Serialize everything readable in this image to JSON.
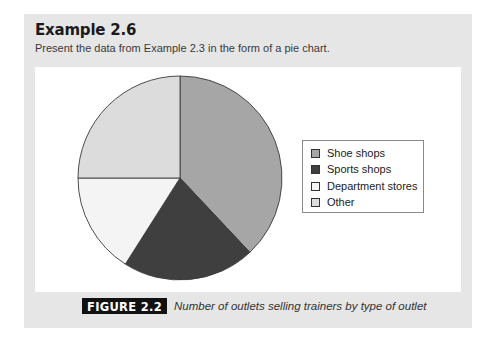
{
  "header": {
    "title": "Example 2.6",
    "subtitle": "Present the data from Example 2.3 in the form of a pie chart."
  },
  "figure": {
    "label": "FIGURE 2.2",
    "caption": "Number of outlets selling trainers by type of outlet"
  },
  "legend": {
    "items": [
      {
        "label": "Shoe shops",
        "color": "#a6a6a6"
      },
      {
        "label": "Sports shops",
        "color": "#3f3f3f"
      },
      {
        "label": "Department stores",
        "color": "#f4f4f4"
      },
      {
        "label": "Other",
        "color": "#dcdcdc"
      }
    ]
  },
  "chart_data": {
    "type": "pie",
    "title": "Number of outlets selling trainers by type of outlet",
    "categories": [
      "Shoe shops",
      "Sports shops",
      "Department stores",
      "Other"
    ],
    "values": [
      38,
      21,
      16,
      25
    ],
    "units": "approximate percentage of outlets (estimated from slice angles)",
    "colors": [
      "#a6a6a6",
      "#3f3f3f",
      "#f4f4f4",
      "#dcdcdc"
    ],
    "start_angle": "12 o'clock, clockwise",
    "legend_position": "right",
    "grid": false
  }
}
